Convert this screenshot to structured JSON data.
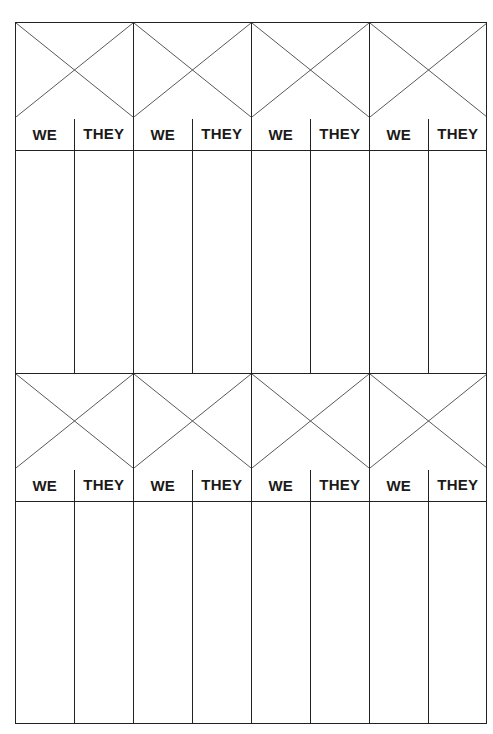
{
  "sheet": {
    "type": "score-sheet",
    "line_color": "#222222",
    "blocks": [
      {
        "games": [
          {
            "we_label": "WE",
            "they_label": "THEY"
          },
          {
            "we_label": "WE",
            "they_label": "THEY"
          },
          {
            "we_label": "WE",
            "they_label": "THEY"
          },
          {
            "we_label": "WE",
            "they_label": "THEY"
          }
        ]
      },
      {
        "games": [
          {
            "we_label": "WE",
            "they_label": "THEY"
          },
          {
            "we_label": "WE",
            "they_label": "THEY"
          },
          {
            "we_label": "WE",
            "they_label": "THEY"
          },
          {
            "we_label": "WE",
            "they_label": "THEY"
          }
        ]
      }
    ]
  }
}
